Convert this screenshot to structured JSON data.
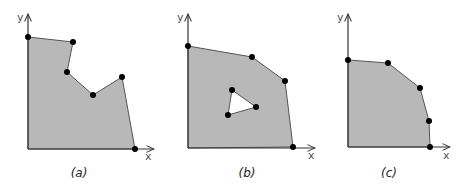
{
  "colors": {
    "region_fill": "#b8b8b8",
    "region_stroke": "#555555",
    "axis": "#333333",
    "vertex": "#000000",
    "hole_fill": "#ffffff"
  },
  "panels": [
    {
      "caption": "(a)",
      "x_label": "x",
      "y_label": "y",
      "origin": [
        28,
        149
      ],
      "polygon": [
        [
          28,
          149
        ],
        [
          28,
          37
        ],
        [
          73,
          42
        ],
        [
          67,
          72
        ],
        [
          93,
          95
        ],
        [
          122,
          77
        ],
        [
          135,
          149
        ]
      ],
      "vertices": [
        [
          28,
          37
        ],
        [
          73,
          42
        ],
        [
          67,
          72
        ],
        [
          93,
          95
        ],
        [
          122,
          77
        ],
        [
          135,
          149
        ]
      ],
      "hole": []
    },
    {
      "caption": "(b)",
      "x_label": "x",
      "y_label": "y",
      "origin": [
        188,
        148
      ],
      "polygon": [
        [
          188,
          148
        ],
        [
          188,
          46
        ],
        [
          252,
          57
        ],
        [
          285,
          81
        ],
        [
          293,
          147
        ]
      ],
      "vertices": [
        [
          188,
          46
        ],
        [
          252,
          57
        ],
        [
          285,
          81
        ],
        [
          293,
          147
        ],
        [
          232,
          90
        ],
        [
          256,
          107
        ],
        [
          228,
          115
        ]
      ],
      "hole": [
        [
          232,
          90
        ],
        [
          256,
          107
        ],
        [
          228,
          115
        ]
      ]
    },
    {
      "caption": "(c)",
      "x_label": "x",
      "y_label": "y",
      "origin": [
        348,
        147
      ],
      "polygon": [
        [
          348,
          147
        ],
        [
          348,
          60
        ],
        [
          388,
          63
        ],
        [
          420,
          88
        ],
        [
          429,
          121
        ],
        [
          430,
          147
        ]
      ],
      "vertices": [
        [
          348,
          60
        ],
        [
          388,
          63
        ],
        [
          420,
          88
        ],
        [
          429,
          121
        ],
        [
          430,
          147
        ]
      ],
      "hole": []
    }
  ]
}
